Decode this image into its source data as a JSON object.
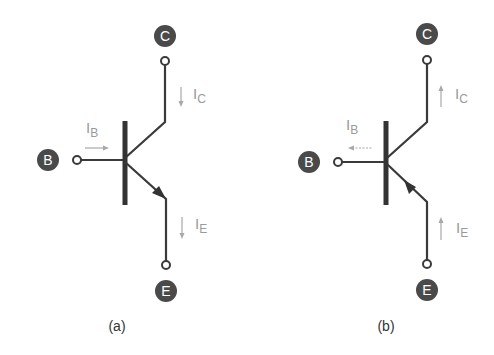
{
  "diagrams": [
    {
      "id": "a",
      "caption": "(a)",
      "type": "NPN transistor",
      "terminals": {
        "collector": "C",
        "base": "B",
        "emitter": "E"
      },
      "currents": {
        "base": {
          "symbol": "I",
          "sub": "B",
          "direction": "into base (right)"
        },
        "collector": {
          "symbol": "I",
          "sub": "C",
          "direction": "down"
        },
        "emitter": {
          "symbol": "I",
          "sub": "E",
          "direction": "down"
        }
      },
      "emitter_arrow": "outward"
    },
    {
      "id": "b",
      "caption": "(b)",
      "type": "PNP transistor",
      "terminals": {
        "collector": "C",
        "base": "B",
        "emitter": "E"
      },
      "currents": {
        "base": {
          "symbol": "I",
          "sub": "B",
          "direction": "out of base (left)"
        },
        "collector": {
          "symbol": "I",
          "sub": "C",
          "direction": "up"
        },
        "emitter": {
          "symbol": "I",
          "sub": "E",
          "direction": "up"
        }
      },
      "emitter_arrow": "inward"
    }
  ],
  "colors": {
    "wire": "#3a3a3a",
    "badge": "#4a4a4a",
    "current": "#a8a8a8"
  }
}
